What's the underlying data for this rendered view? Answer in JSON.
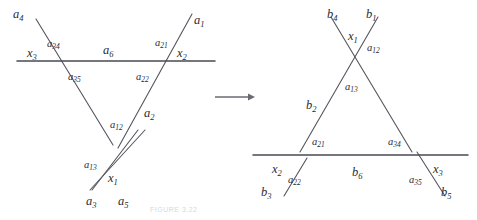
{
  "figure": {
    "caption": "FIGURE 3.22",
    "arrow": {
      "symbol": "→",
      "x": 215,
      "y": 97,
      "length": 40
    },
    "stroke_color": "#4a4a55",
    "line_color": "#55555f",
    "background": "#ffffff"
  },
  "left_graph": {
    "name": "left-diagram",
    "horizontal_edge_label": "a",
    "horizontal_edge_sub": "6",
    "labels": [
      {
        "id": "a4",
        "base": "a",
        "sub": "4",
        "x": 13,
        "y": 8,
        "size": "main"
      },
      {
        "id": "a34",
        "base": "a",
        "sub": "34",
        "x": 47,
        "y": 39,
        "size": "sub"
      },
      {
        "id": "x3",
        "base": "x",
        "sub": "3",
        "x": 27,
        "y": 47,
        "size": "main"
      },
      {
        "id": "a6",
        "base": "a",
        "sub": "6",
        "x": 103,
        "y": 44,
        "size": "main"
      },
      {
        "id": "a21",
        "base": "a",
        "sub": "21",
        "x": 155,
        "y": 38,
        "size": "sub"
      },
      {
        "id": "a1",
        "base": "a",
        "sub": "1",
        "x": 194,
        "y": 14,
        "size": "main"
      },
      {
        "id": "x2",
        "base": "x",
        "sub": "2",
        "x": 177,
        "y": 47,
        "size": "main"
      },
      {
        "id": "a35",
        "base": "a",
        "sub": "35",
        "x": 68,
        "y": 72,
        "size": "sub"
      },
      {
        "id": "a22",
        "base": "a",
        "sub": "22",
        "x": 136,
        "y": 72,
        "size": "sub"
      },
      {
        "id": "a2",
        "base": "a",
        "sub": "2",
        "x": 144,
        "y": 107,
        "size": "main"
      },
      {
        "id": "a12",
        "base": "a",
        "sub": "12",
        "x": 110,
        "y": 120,
        "size": "sub"
      },
      {
        "id": "a13",
        "base": "a",
        "sub": "13",
        "x": 84,
        "y": 160,
        "size": "sub"
      },
      {
        "id": "x1",
        "base": "x",
        "sub": "1",
        "x": 108,
        "y": 172,
        "size": "main"
      },
      {
        "id": "a3",
        "base": "a",
        "sub": "3",
        "x": 86,
        "y": 195,
        "size": "main"
      },
      {
        "id": "a5",
        "base": "a",
        "sub": "5",
        "x": 118,
        "y": 195,
        "size": "main"
      }
    ],
    "segments": [
      {
        "id": "a4-a35",
        "x1": 36,
        "y1": 19,
        "x2": 113,
        "y2": 145
      },
      {
        "id": "a1-a2",
        "x1": 192,
        "y1": 14,
        "x2": 118,
        "y2": 148
      },
      {
        "id": "a13-a5",
        "x1": 90,
        "y1": 190,
        "x2": 145,
        "y2": 130
      },
      {
        "id": "a3-a12",
        "x1": 92,
        "y1": 190,
        "x2": 138,
        "y2": 130
      },
      {
        "id": "a6-line",
        "x1": 17,
        "y1": 61,
        "x2": 215,
        "y2": 61
      }
    ]
  },
  "right_graph": {
    "name": "right-diagram",
    "horizontal_edge_label": "b",
    "horizontal_edge_sub": "6",
    "labels": [
      {
        "id": "b4",
        "base": "b",
        "sub": "4",
        "x": 327,
        "y": 8,
        "size": "main"
      },
      {
        "id": "b1",
        "base": "b",
        "sub": "1",
        "x": 366,
        "y": 8,
        "size": "main"
      },
      {
        "id": "x1",
        "base": "x",
        "sub": "1",
        "x": 348,
        "y": 30,
        "size": "main"
      },
      {
        "id": "a12",
        "base": "a",
        "sub": "12",
        "x": 367,
        "y": 43,
        "size": "sub"
      },
      {
        "id": "a13",
        "base": "a",
        "sub": "13",
        "x": 345,
        "y": 82,
        "size": "sub"
      },
      {
        "id": "b2",
        "base": "b",
        "sub": "2",
        "x": 306,
        "y": 99,
        "size": "main"
      },
      {
        "id": "a21",
        "base": "a",
        "sub": "21",
        "x": 312,
        "y": 137,
        "size": "sub"
      },
      {
        "id": "a34",
        "base": "a",
        "sub": "34",
        "x": 388,
        "y": 137,
        "size": "sub"
      },
      {
        "id": "x2",
        "base": "x",
        "sub": "2",
        "x": 272,
        "y": 163,
        "size": "main"
      },
      {
        "id": "b6",
        "base": "b",
        "sub": "6",
        "x": 352,
        "y": 166,
        "size": "main"
      },
      {
        "id": "x3",
        "base": "x",
        "sub": "3",
        "x": 433,
        "y": 163,
        "size": "main"
      },
      {
        "id": "a22",
        "base": "a",
        "sub": "22",
        "x": 288,
        "y": 175,
        "size": "sub"
      },
      {
        "id": "a35",
        "base": "a",
        "sub": "35",
        "x": 409,
        "y": 175,
        "size": "sub"
      },
      {
        "id": "b3",
        "base": "b",
        "sub": "3",
        "x": 261,
        "y": 186,
        "size": "main"
      },
      {
        "id": "b5",
        "base": "b",
        "sub": "5",
        "x": 441,
        "y": 186,
        "size": "main"
      }
    ],
    "segments": [
      {
        "id": "b4-a34",
        "x1": 331,
        "y1": 17,
        "x2": 412,
        "y2": 152
      },
      {
        "id": "b1-a21",
        "x1": 378,
        "y1": 17,
        "x2": 300,
        "y2": 152
      },
      {
        "id": "x2-a22",
        "x1": 284,
        "y1": 196,
        "x2": 307,
        "y2": 158
      },
      {
        "id": "x3-b5",
        "x1": 445,
        "y1": 196,
        "x2": 417,
        "y2": 152
      },
      {
        "id": "b6-line",
        "x1": 253,
        "y1": 155,
        "x2": 468,
        "y2": 155
      }
    ]
  }
}
